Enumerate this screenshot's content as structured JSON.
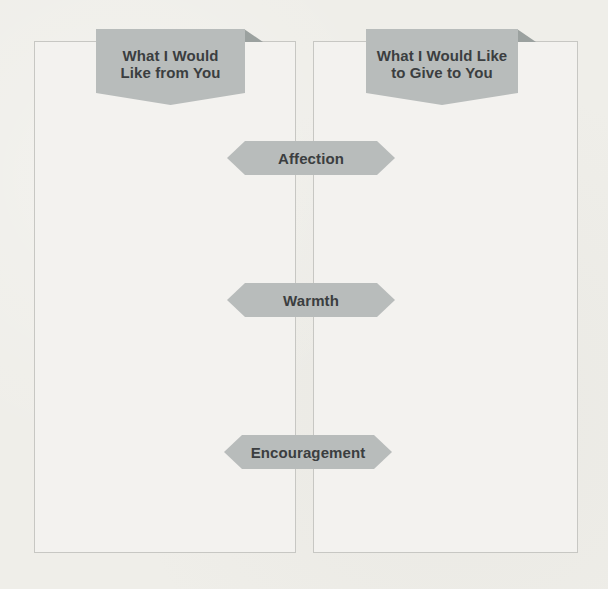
{
  "columns": {
    "left": {
      "header_label": "What I Would\nLike from You"
    },
    "right": {
      "header_label": "What I Would Like\nto Give to You"
    }
  },
  "tags": [
    {
      "label": "Affection"
    },
    {
      "label": "Warmth"
    },
    {
      "label": "Encouragement"
    }
  ],
  "colors": {
    "page_background": "#efeee9",
    "box_fill": "#f3f2ef",
    "box_border": "#c7c7c3",
    "banner_fill": "#b8bcbb",
    "banner_fold": "#9ba19f",
    "tag_fill": "#b8bcbb",
    "text": "#3b3e40"
  }
}
